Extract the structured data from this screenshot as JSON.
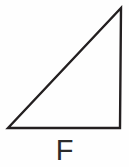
{
  "figure": {
    "canvas": {
      "width": 129,
      "height": 167,
      "background_color": "#fefefe"
    },
    "label": "F",
    "label_color": "#2b2b2b",
    "shape": {
      "name": "right-triangle",
      "fill": "none",
      "stroke_color": "#231f20",
      "stroke_width": 2.4,
      "vertices": [
        {
          "name": "bottom-left",
          "x": 8,
          "y": 128
        },
        {
          "name": "top-right-apex",
          "x": 121,
          "y": 8
        },
        {
          "name": "bottom-right",
          "x": 120,
          "y": 128
        }
      ],
      "points_attr": "8,128 121,8 120,128",
      "edges": [
        {
          "name": "hypotenuse",
          "from": "bottom-left",
          "to": "top-right-apex"
        },
        {
          "name": "right-vertical-leg",
          "from": "top-right-apex",
          "to": "bottom-right"
        },
        {
          "name": "bottom-horizontal-leg",
          "from": "bottom-right",
          "to": "bottom-left"
        }
      ],
      "right_angle_at": "bottom-right"
    }
  }
}
